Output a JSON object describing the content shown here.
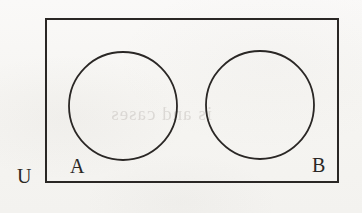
{
  "figure": {
    "kind": "venn-diagram",
    "background_color": "#f8f7f5",
    "ink_color": "#2a2725"
  },
  "universe": {
    "label": "U",
    "shape": "rectangle",
    "stroke_color": "#2a2725",
    "stroke_width": 2,
    "x": 46,
    "y": 19,
    "width": 292,
    "height": 163
  },
  "sets": [
    {
      "label": "A",
      "shape": "circle",
      "cx": 123,
      "cy": 106,
      "r": 54,
      "stroke_color": "#2a2725",
      "stroke_width": 1.8,
      "fill": "none"
    },
    {
      "label": "B",
      "shape": "circle",
      "cx": 260,
      "cy": 105,
      "r": 54,
      "stroke_color": "#2a2725",
      "stroke_width": 1.8,
      "fill": "none"
    }
  ],
  "artifacts": {
    "bleed_through_text": "is and cases"
  }
}
